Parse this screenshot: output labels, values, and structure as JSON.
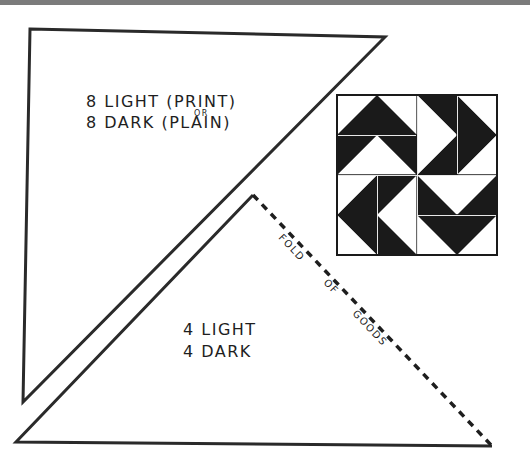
{
  "page": {
    "background": "#ffffff",
    "top_bar_color": "#7b7b7b",
    "ink_color": "#1e1e1e"
  },
  "upper_template": {
    "shape": "large-right-triangle",
    "label_line1": "8 LIGHT (PRINT)",
    "label_or": "OR",
    "label_line2": "8 DARK (PLAIN)"
  },
  "lower_template": {
    "shape": "half-triangle",
    "label_line1": "4 LIGHT",
    "label_line2": "4 DARK",
    "fold_label_words": [
      "FOLD",
      "OF",
      "GOODS"
    ]
  },
  "quilt_block": {
    "grid": "4x4",
    "dark_color": "#1a1a1a",
    "light_color": "#ffffff",
    "quadrants": [
      {
        "position": "top-left",
        "direction": "up"
      },
      {
        "position": "top-right",
        "direction": "right"
      },
      {
        "position": "bottom-left",
        "direction": "left"
      },
      {
        "position": "bottom-right",
        "direction": "down"
      }
    ]
  }
}
